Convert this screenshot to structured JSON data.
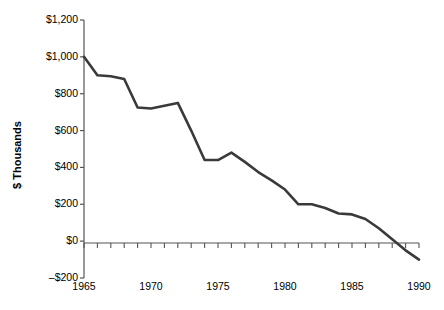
{
  "chart_data": {
    "type": "line",
    "title": "",
    "xlabel": "",
    "ylabel": "$ Thousands",
    "xlim": [
      1965,
      1990
    ],
    "ylim": [
      -200,
      1200
    ],
    "ytick_values": [
      1200,
      1000,
      800,
      600,
      400,
      200,
      0,
      -200
    ],
    "ytick_labels": [
      "$1,200",
      "$1,000",
      "$800",
      "$600",
      "$400",
      "$200",
      "$0",
      "–$200"
    ],
    "xtick_values": [
      1965,
      1970,
      1975,
      1980,
      1985,
      1990
    ],
    "xtick_labels": [
      "1965",
      "1970",
      "1975",
      "1980",
      "1985",
      "1990"
    ],
    "minor_xticks_every": 1,
    "grid": false,
    "legend": "none",
    "zero_line": true,
    "line_color": "#3a3a3a",
    "line_width": 2.6,
    "x": [
      1965,
      1966,
      1967,
      1968,
      1969,
      1970,
      1971,
      1972,
      1973,
      1974,
      1975,
      1976,
      1977,
      1978,
      1979,
      1980,
      1981,
      1982,
      1983,
      1984,
      1985,
      1986,
      1987,
      1988,
      1989,
      1990
    ],
    "values": [
      1000,
      900,
      895,
      880,
      725,
      720,
      735,
      750,
      600,
      440,
      440,
      480,
      430,
      375,
      330,
      280,
      200,
      200,
      180,
      150,
      145,
      120,
      70,
      10,
      -50,
      -100
    ],
    "series": [
      {
        "name": "value",
        "values": [
          1000,
          900,
          895,
          880,
          725,
          720,
          735,
          750,
          600,
          440,
          440,
          480,
          430,
          375,
          330,
          280,
          200,
          200,
          180,
          150,
          145,
          120,
          70,
          10,
          -50,
          -100
        ]
      }
    ]
  },
  "axes": {
    "ylabel_text": "$ Thousands"
  }
}
